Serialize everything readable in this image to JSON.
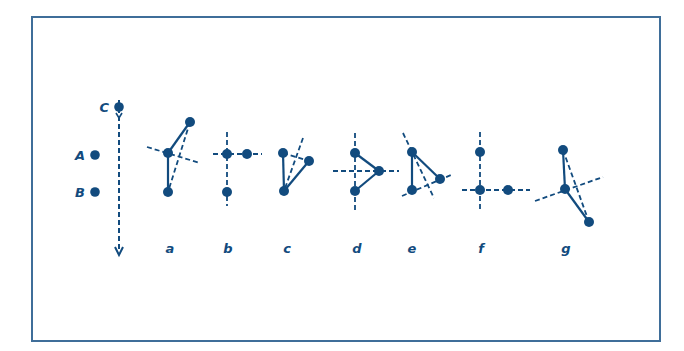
{
  "colors": {
    "ink": "#124b7e",
    "frame": "#3f6e99",
    "background": "#ffffff"
  },
  "reference": {
    "points": [
      {
        "label": "A",
        "x": 95,
        "y": 155
      },
      {
        "label": "B",
        "x": 95,
        "y": 192
      },
      {
        "label": "C",
        "x": 119,
        "y": 107
      }
    ],
    "arrow": {
      "x": 119,
      "y1": 100,
      "y2": 255,
      "style": "dashed",
      "direction": "down"
    }
  },
  "configurations": [
    {
      "label": "a",
      "label_x": 170,
      "points": [
        [
          190,
          122
        ],
        [
          168,
          153
        ],
        [
          168,
          192
        ]
      ],
      "solid": [
        [
          [
            190,
            122
          ],
          [
            168,
            153
          ]
        ],
        [
          [
            168,
            153
          ],
          [
            168,
            192
          ]
        ]
      ],
      "dashed": [
        [
          [
            147,
            147
          ],
          [
            200,
            163
          ]
        ],
        [
          [
            190,
            122
          ],
          [
            168,
            192
          ]
        ]
      ]
    },
    {
      "label": "b",
      "label_x": 228,
      "points": [
        [
          227,
          154
        ],
        [
          247,
          154
        ],
        [
          227,
          192
        ]
      ],
      "solid": [],
      "dashed": [
        [
          [
            227,
            132
          ],
          [
            227,
            206
          ]
        ],
        [
          [
            213,
            154
          ],
          [
            262,
            154
          ]
        ]
      ]
    },
    {
      "label": "c",
      "label_x": 287,
      "points": [
        [
          283,
          153
        ],
        [
          309,
          161
        ],
        [
          284,
          191
        ]
      ],
      "solid": [
        [
          [
            283,
            153
          ],
          [
            284,
            191
          ]
        ],
        [
          [
            309,
            161
          ],
          [
            284,
            191
          ]
        ]
      ],
      "dashed": [
        [
          [
            303,
            138
          ],
          [
            284,
            191
          ]
        ],
        [
          [
            283,
            153
          ],
          [
            309,
            161
          ]
        ]
      ]
    },
    {
      "label": "d",
      "label_x": 357,
      "points": [
        [
          355,
          153
        ],
        [
          379,
          171
        ],
        [
          355,
          191
        ]
      ],
      "solid": [
        [
          [
            355,
            153
          ],
          [
            379,
            171
          ]
        ],
        [
          [
            355,
            191
          ],
          [
            379,
            171
          ]
        ]
      ],
      "dashed": [
        [
          [
            355,
            133
          ],
          [
            355,
            211
          ]
        ],
        [
          [
            333,
            171
          ],
          [
            399,
            171
          ]
        ]
      ]
    },
    {
      "label": "e",
      "label_x": 412,
      "points": [
        [
          412,
          152
        ],
        [
          440,
          179
        ],
        [
          412,
          190
        ]
      ],
      "solid": [
        [
          [
            412,
            152
          ],
          [
            412,
            190
          ]
        ],
        [
          [
            412,
            152
          ],
          [
            440,
            179
          ]
        ]
      ],
      "dashed": [
        [
          [
            403,
            133
          ],
          [
            434,
            198
          ]
        ],
        [
          [
            402,
            196
          ],
          [
            451,
            175
          ]
        ]
      ]
    },
    {
      "label": "f",
      "label_x": 481,
      "points": [
        [
          480,
          152
        ],
        [
          480,
          190
        ],
        [
          508,
          190
        ]
      ],
      "solid": [],
      "dashed": [
        [
          [
            480,
            132
          ],
          [
            480,
            210
          ]
        ],
        [
          [
            462,
            190
          ],
          [
            530,
            190
          ]
        ]
      ]
    },
    {
      "label": "g",
      "label_x": 566,
      "points": [
        [
          563,
          150
        ],
        [
          565,
          189
        ],
        [
          589,
          222
        ]
      ],
      "solid": [
        [
          [
            563,
            150
          ],
          [
            565,
            189
          ]
        ],
        [
          [
            565,
            189
          ],
          [
            589,
            222
          ]
        ]
      ],
      "dashed": [
        [
          [
            535,
            201
          ],
          [
            603,
            177
          ]
        ],
        [
          [
            563,
            150
          ],
          [
            589,
            222
          ]
        ]
      ]
    }
  ],
  "label_y": 253
}
